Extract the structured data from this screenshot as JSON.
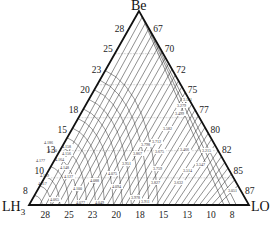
{
  "diagram": {
    "type": "ternary",
    "vertices": {
      "top": {
        "label": "Be",
        "x": 139,
        "y": 11
      },
      "left": {
        "label": "LH3",
        "main": "LH",
        "sub": "3",
        "x": 29,
        "y": 205
      },
      "right": {
        "label": "LO",
        "x": 249,
        "y": 205
      }
    },
    "left_axis_ticks": [
      "28",
      "25",
      "23",
      "20",
      "18",
      "15",
      "13",
      "10",
      "8"
    ],
    "right_axis_ticks": [
      "67",
      "70",
      "72",
      "75",
      "77",
      "80",
      "82",
      "85",
      "87"
    ],
    "bottom_axis_ticks": [
      "28",
      "25",
      "23",
      "20",
      "18",
      "15",
      "13",
      "10",
      "8"
    ],
    "contour_labels": [
      {
        "text": "4.186",
        "x": 44,
        "y": 144
      },
      {
        "text": "4.158",
        "x": 62,
        "y": 148
      },
      {
        "text": "4.170",
        "x": 48,
        "y": 152
      },
      {
        "text": "4.156",
        "x": 62,
        "y": 155
      },
      {
        "text": "4.177",
        "x": 36,
        "y": 162
      },
      {
        "text": "4.164",
        "x": 55,
        "y": 161
      },
      {
        "text": "4.148",
        "x": 60,
        "y": 169
      },
      {
        "text": "4.139",
        "x": 40,
        "y": 177
      },
      {
        "text": "4.127",
        "x": 64,
        "y": 178
      },
      {
        "text": "4.117",
        "x": 38,
        "y": 185
      },
      {
        "text": "4.088",
        "x": 90,
        "y": 182
      },
      {
        "text": "4.100",
        "x": 73,
        "y": 190
      },
      {
        "text": "4.065",
        "x": 50,
        "y": 201
      },
      {
        "text": "4.075",
        "x": 108,
        "y": 175
      },
      {
        "text": "4.094",
        "x": 112,
        "y": 188
      },
      {
        "text": "4.077",
        "x": 76,
        "y": 204
      },
      {
        "text": "4.049",
        "x": 95,
        "y": 204
      },
      {
        "text": "3.978",
        "x": 131,
        "y": 199
      },
      {
        "text": "3.911",
        "x": 141,
        "y": 203
      },
      {
        "text": "3.951",
        "x": 122,
        "y": 165
      },
      {
        "text": "3.867",
        "x": 133,
        "y": 155
      },
      {
        "text": "3.798",
        "x": 141,
        "y": 146
      },
      {
        "text": "3.712",
        "x": 152,
        "y": 143
      },
      {
        "text": "3.675",
        "x": 155,
        "y": 153
      },
      {
        "text": "3.759",
        "x": 153,
        "y": 170
      },
      {
        "text": "3.827",
        "x": 151,
        "y": 184
      },
      {
        "text": "3.632",
        "x": 174,
        "y": 184
      },
      {
        "text": "3.582",
        "x": 163,
        "y": 130
      },
      {
        "text": "3.499",
        "x": 175,
        "y": 115
      },
      {
        "text": "3.279",
        "x": 177,
        "y": 107
      },
      {
        "text": "3.141",
        "x": 183,
        "y": 101
      },
      {
        "text": "3.466",
        "x": 180,
        "y": 151
      },
      {
        "text": "3.547",
        "x": 196,
        "y": 166
      },
      {
        "text": "3.514",
        "x": 183,
        "y": 172
      },
      {
        "text": "3.215",
        "x": 202,
        "y": 152
      },
      {
        "text": "3.051",
        "x": 228,
        "y": 192
      }
    ],
    "colors": {
      "frame": "#111111",
      "contour": "#333333",
      "grid": "#888888",
      "background": "#ffffff"
    }
  }
}
